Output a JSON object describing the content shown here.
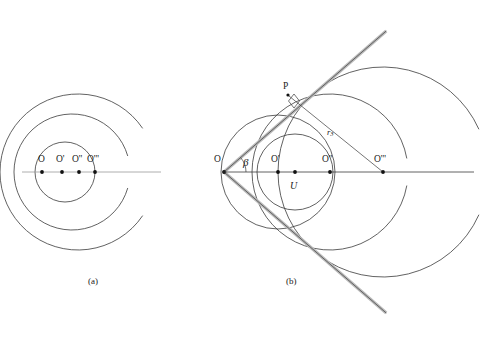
{
  "figure": {
    "background": "#ffffff",
    "stroke_dark": "#3a3a3a",
    "stroke_light": "#9a9a9a",
    "stroke_highlight": "#b9b9b9",
    "panels": [
      {
        "id": "panel-a",
        "caption": "(a)",
        "caption_pos": [
          88,
          277
        ],
        "axis": {
          "x1": 22,
          "y1": 172,
          "x2": 161,
          "y2": 172
        },
        "points": [
          {
            "label": "O",
            "x": 42,
            "y": 172,
            "label_x": 38,
            "label_y": 155
          },
          {
            "label": "O'",
            "x": 62,
            "y": 172,
            "label_x": 56,
            "label_y": 155
          },
          {
            "label": "O''",
            "x": 79,
            "y": 172,
            "label_x": 72,
            "label_y": 155
          },
          {
            "label": "O'''",
            "x": 95,
            "y": 172,
            "label_x": 87,
            "label_y": 155
          }
        ],
        "circles": [
          {
            "name": "inner-circle",
            "cx": 65,
            "cy": 172,
            "r": 30,
            "closed": true,
            "gap_deg": 0
          },
          {
            "name": "middle-circle",
            "cx": 72,
            "cy": 172,
            "r": 58,
            "closed": false,
            "gap_deg": 16
          },
          {
            "name": "outer-circle",
            "cx": 78,
            "cy": 172,
            "r": 78,
            "closed": false,
            "gap_deg": 34
          }
        ]
      },
      {
        "id": "panel-b",
        "caption": "(b)",
        "caption_pos": [
          286,
          277
        ],
        "axis": {
          "x1": 222,
          "y1": 172,
          "x2": 474,
          "y2": 172
        },
        "vertex": {
          "label": "O",
          "x": 224,
          "y": 172,
          "label_x": 214,
          "label_y": 155
        },
        "angle_label": "β",
        "angle_label_pos": [
          243,
          157
        ],
        "angle_arc_radius": 22,
        "tangent_half_angle_deg": 41,
        "tangent_length": 215,
        "tangent_point": {
          "label": "P",
          "x": 288,
          "y": 95,
          "label_x": 283,
          "label_y": 82
        },
        "right_angle_marker": {
          "x": 294,
          "y": 101,
          "size": 7
        },
        "radius_label": "r",
        "radius_subscript": "3",
        "radius_label_pos": [
          327,
          128
        ],
        "radius_line": {
          "x1": 289,
          "y1": 96,
          "x2": 383,
          "y2": 172
        },
        "points": [
          {
            "label": "O'",
            "x": 278,
            "y": 172,
            "label_x": 271,
            "label_y": 155
          },
          {
            "label": "O''",
            "x": 330,
            "y": 172,
            "label_x": 322,
            "label_y": 155
          },
          {
            "label": "O'''",
            "x": 383,
            "y": 172,
            "label_x": 374,
            "label_y": 155
          }
        ],
        "italic_point": {
          "label": "U",
          "x": 295,
          "y": 172,
          "label_x": 290,
          "label_y": 181
        },
        "circles": [
          {
            "name": "circle-U",
            "cx": 295,
            "cy": 172,
            "r": 38,
            "closed": true,
            "gap_deg": 0
          },
          {
            "name": "circle-O-prime",
            "cx": 278,
            "cy": 172,
            "r": 57,
            "closed": true,
            "gap_deg": 0
          },
          {
            "name": "circle-O-2",
            "cx": 330,
            "cy": 172,
            "r": 78,
            "closed": false,
            "gap_deg": 10
          },
          {
            "name": "circle-O-3",
            "cx": 383,
            "cy": 172,
            "r": 105,
            "closed": false,
            "gap_deg": 24
          }
        ]
      }
    ]
  }
}
